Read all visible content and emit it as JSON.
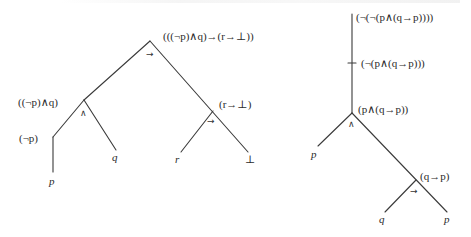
{
  "diagram": {
    "left_tree": {
      "root": {
        "label": "(((¬p)∧q)→(r→⊥))",
        "operator": "→"
      },
      "nodes": [
        {
          "id": "n1",
          "label": "((¬p)∧q)",
          "operator": "∧"
        },
        {
          "id": "n2",
          "label": "(r→⊥)",
          "operator": "→"
        },
        {
          "id": "n3",
          "label": "(¬p)",
          "operator": ""
        }
      ],
      "leaves": [
        {
          "id": "l1",
          "label": "p"
        },
        {
          "id": "l2",
          "label": "q"
        },
        {
          "id": "l3",
          "label": "r"
        },
        {
          "id": "l4",
          "label": "⊥"
        }
      ]
    },
    "right_tree": {
      "root": {
        "label": "(¬(¬(p∧(q→p))))",
        "operator": ""
      },
      "nodes": [
        {
          "id": "m1",
          "label": "(¬(p∧(q→p)))",
          "operator": ""
        },
        {
          "id": "m2",
          "label": "(p∧(q→p))",
          "operator": "∧"
        },
        {
          "id": "m3",
          "label": "(q→p)",
          "operator": "→"
        }
      ],
      "leaves": [
        {
          "id": "k1",
          "label": "p"
        },
        {
          "id": "k2",
          "label": "q"
        },
        {
          "id": "k3",
          "label": "p"
        }
      ]
    },
    "line_color": "#3a3a3a"
  }
}
